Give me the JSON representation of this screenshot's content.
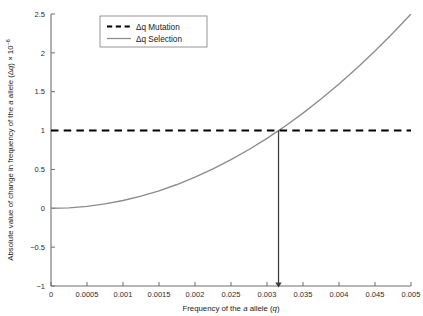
{
  "chart_data": {
    "type": "line",
    "title": "",
    "xlabel": "Frequency of the a allele (q)",
    "ylabel": "Absolute value of change in frequency of the a allele (Δq) × 10⁻⁶",
    "xlim": [
      0,
      0.005
    ],
    "ylim": [
      -1,
      2.5
    ],
    "grid": false,
    "legend_position": "top-center",
    "xticks": [
      0,
      0.0005,
      0.001,
      0.0015,
      0.002,
      0.0025,
      0.003,
      0.0035,
      0.004,
      0.0045,
      0.005
    ],
    "xtick_labels": [
      "0",
      "0.0005",
      "0.001",
      "0.0015",
      "0.002",
      "0.025",
      "0.003",
      "0.035",
      "0.004",
      "0.045",
      "0.005"
    ],
    "yticks": [
      -1,
      -0.5,
      0,
      0.5,
      1,
      1.5,
      2,
      2.5
    ],
    "ytick_labels": [
      "−1",
      "−0.5",
      "0",
      "0.5",
      "1",
      "1.5",
      "2",
      "2.5"
    ],
    "series": [
      {
        "name": "Δq Mutation",
        "style": "dashed",
        "color": "#000000",
        "x": [
          0,
          0.005
        ],
        "values": [
          1.0,
          1.0
        ]
      },
      {
        "name": "Δq Selection",
        "style": "solid",
        "color": "#8c8c8c",
        "x": [
          0,
          0.00025,
          0.0005,
          0.00075,
          0.001,
          0.00125,
          0.0015,
          0.00175,
          0.002,
          0.00225,
          0.0025,
          0.00275,
          0.003,
          0.00316,
          0.00325,
          0.0035,
          0.00375,
          0.004,
          0.00425,
          0.0045,
          0.00475,
          0.005
        ],
        "values": [
          0.0,
          0.006,
          0.025,
          0.056,
          0.1,
          0.156,
          0.225,
          0.306,
          0.4,
          0.506,
          0.625,
          0.756,
          0.9,
          1.0,
          1.056,
          1.225,
          1.406,
          1.6,
          1.806,
          2.025,
          2.256,
          2.5
        ]
      }
    ],
    "annotations": [
      {
        "type": "arrow",
        "name": "equilibrium-arrow",
        "x": 0.00316,
        "y_start": 1.0,
        "y_end": -1.0,
        "color": "#3a3a3a"
      }
    ]
  },
  "legend": {
    "entries": [
      {
        "label": "Δq Mutation"
      },
      {
        "label": "Δq Selection"
      }
    ]
  },
  "axis_labels": {
    "x_prefix": "Frequency of the ",
    "x_italic_a": "a",
    "x_mid": " allele (",
    "x_italic_q": "q",
    "x_suffix": ")",
    "y_prefix": "Absolute value of change in frequency of the ",
    "y_italic_a": "a",
    "y_mid": " allele (Δ",
    "y_italic_q": "q",
    "y_suffix": ") × 10",
    "y_exponent": "−6"
  }
}
